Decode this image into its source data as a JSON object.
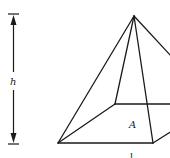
{
  "figure": {
    "stroke_color": "#1a1a1a",
    "background_color": "#ffffff"
  },
  "labels": {
    "height": "h",
    "base_area": "A",
    "base_edge": "l"
  },
  "dimension": {
    "height_label": "h",
    "orientation": "vertical",
    "arrows": "both-ends"
  },
  "geometry": {
    "apex": [
      134,
      16
    ],
    "base_front_left": [
      58,
      143
    ],
    "base_front_right": [
      153,
      143
    ],
    "base_back_left": [
      115,
      104
    ],
    "base_back_right_offscreen": [
      190,
      104
    ]
  }
}
